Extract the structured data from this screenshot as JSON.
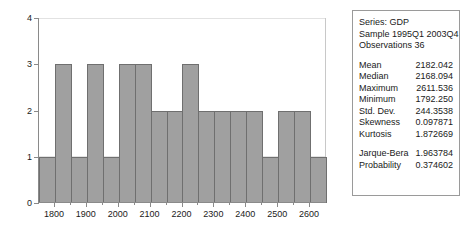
{
  "chart_data": {
    "type": "bar",
    "title": "",
    "xlabel": "",
    "ylabel": "",
    "grid": true,
    "legend": "none",
    "ylim": [
      0,
      4
    ],
    "yticks": [
      0,
      1,
      2,
      3,
      4
    ],
    "ytick_labels": [
      "0",
      "1",
      "2",
      "3",
      "4"
    ],
    "xlim": [
      1750,
      2650
    ],
    "xticks": [
      1800,
      1900,
      2000,
      2100,
      2200,
      2300,
      2400,
      2500,
      2600
    ],
    "xtick_labels": [
      "1800",
      "1900",
      "2000",
      "2100",
      "2200",
      "2300",
      "2400",
      "2500",
      "2600"
    ],
    "bin_width": 50,
    "categories": [
      "1750-1800",
      "1800-1850",
      "1850-1900",
      "1900-1950",
      "1950-2000",
      "2000-2050",
      "2050-2100",
      "2100-2150",
      "2150-2200",
      "2200-2250",
      "2250-2300",
      "2300-2350",
      "2350-2400",
      "2400-2450",
      "2450-2500",
      "2500-2550",
      "2550-2600",
      "2600-2650"
    ],
    "values": [
      1,
      3,
      1,
      3,
      1,
      3,
      3,
      2,
      2,
      3,
      2,
      2,
      2,
      2,
      1,
      2,
      2,
      1
    ],
    "bar_color": "#a0a0a0",
    "bar_edge_color": "#6f6f6f"
  },
  "stats": {
    "series_line": "Series: GDP",
    "sample_line": "Sample 1995Q1 2003Q4",
    "observations_line": "Observations 36",
    "rows": [
      {
        "label": "Mean",
        "value": "2182.042"
      },
      {
        "label": "Median",
        "value": "2168.094"
      },
      {
        "label": "Maximum",
        "value": "2611.536"
      },
      {
        "label": "Minimum",
        "value": "1792.250"
      },
      {
        "label": "Std. Dev.",
        "value": "244.3538"
      },
      {
        "label": "Skewness",
        "value": "0.097871"
      },
      {
        "label": "Kurtosis",
        "value": "1.872669"
      }
    ],
    "test_rows": [
      {
        "label": "Jarque-Bera",
        "value": "1.963784"
      },
      {
        "label": "Probability",
        "value": "0.374602"
      }
    ]
  }
}
